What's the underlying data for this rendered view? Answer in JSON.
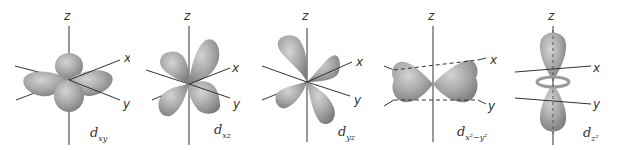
{
  "figure": {
    "lobe_color": "#a9a9a9",
    "lobe_highlight": "#cfcfcf",
    "lobe_shadow": "#8a8a8a",
    "axis_color": "#333333",
    "orbitals": [
      {
        "id": "dxy",
        "label_main": "d",
        "label_sub": "xy",
        "axes": {
          "z": "z",
          "x": "x",
          "y": "y"
        }
      },
      {
        "id": "dxz",
        "label_main": "d",
        "label_sub": "xz",
        "axes": {
          "z": "z",
          "x": "x",
          "y": "y"
        }
      },
      {
        "id": "dyz",
        "label_main": "d",
        "label_sub": "yz",
        "axes": {
          "z": "z",
          "x": "x",
          "y": "y"
        }
      },
      {
        "id": "dx2y2",
        "label_main": "d",
        "label_sub": "x²−y²",
        "axes": {
          "z": "z",
          "x": "x",
          "y": "y"
        }
      },
      {
        "id": "dz2",
        "label_main": "d",
        "label_sub": "z²",
        "axes": {
          "z": "z",
          "x": "x",
          "y": "y"
        }
      }
    ]
  }
}
